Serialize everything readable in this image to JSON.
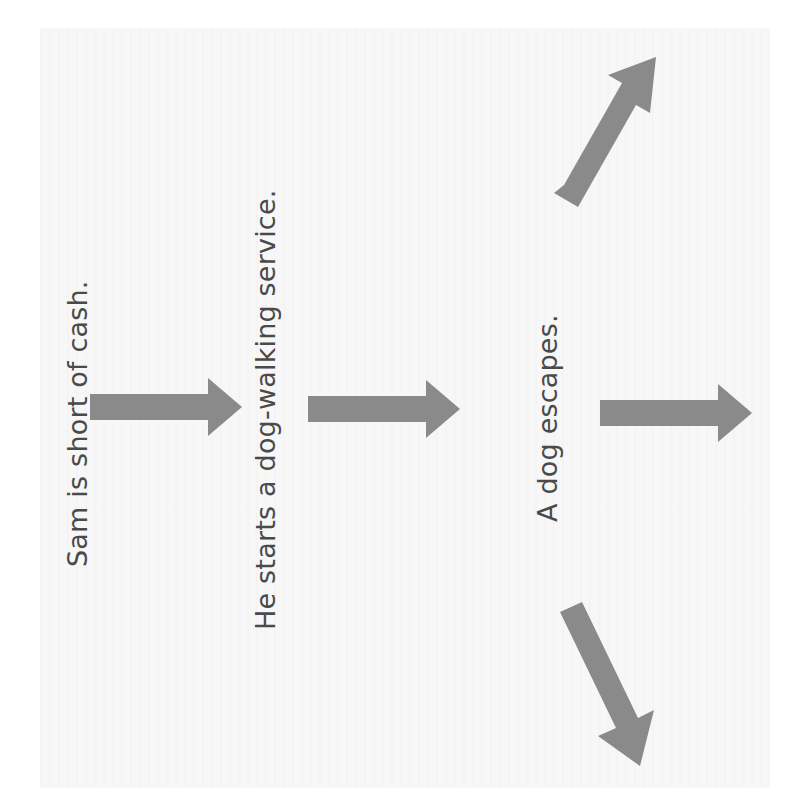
{
  "diagram": {
    "nodes": [
      {
        "id": "n1",
        "label": "Sam is short of cash."
      },
      {
        "id": "n2",
        "label": "He starts a dog-walking service."
      },
      {
        "id": "n3",
        "label": "A dog escapes."
      }
    ],
    "edges": [
      {
        "from": "n1",
        "to": "n2",
        "direction": "right"
      },
      {
        "from": "n2",
        "to": "n3",
        "direction": "right"
      },
      {
        "from": "n3",
        "to": "branch-up",
        "direction": "up-right"
      },
      {
        "from": "n3",
        "to": "branch-middle",
        "direction": "right"
      },
      {
        "from": "n3",
        "to": "branch-down",
        "direction": "down-right"
      }
    ],
    "arrow_color": "#8a8a8a",
    "text_color": "#4a4a4a",
    "orientation": "rotated-90-ccw"
  }
}
